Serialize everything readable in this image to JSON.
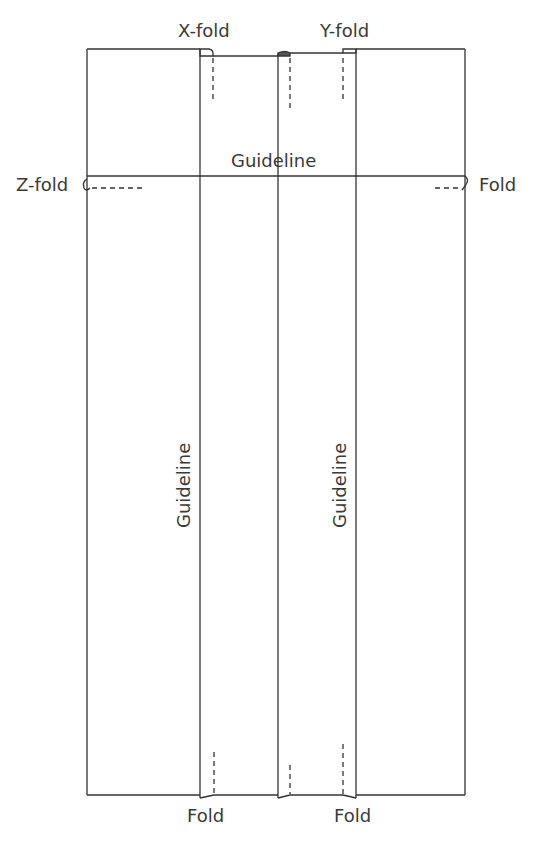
{
  "diagram": {
    "type": "fold-pattern",
    "stroke_color": "#333333",
    "labels": {
      "x_fold": "X-fold",
      "y_fold": "Y-fold",
      "z_fold": "Z-fold",
      "right_fold": "Fold",
      "bottom_fold_left": "Fold",
      "bottom_fold_right": "Fold",
      "guideline_horizontal": "Guideline",
      "guideline_vertical_left": "Guideline",
      "guideline_vertical_right": "Guideline"
    },
    "outline": {
      "left": 87,
      "top": 49,
      "right": 465,
      "bottom": 795
    },
    "guideline_y": 176,
    "vertical_lines_x": [
      200,
      278,
      356
    ],
    "fold_lines_dashed": [
      {
        "name": "x-fold-top",
        "x": 213,
        "y1": 58,
        "y2": 102
      },
      {
        "name": "middle-top",
        "x": 290,
        "y1": 58,
        "y2": 108
      },
      {
        "name": "y-fold-top",
        "x": 343,
        "y1": 58,
        "y2": 103
      },
      {
        "name": "x-fold-bottom",
        "x": 214,
        "y1": 752,
        "y2": 794
      },
      {
        "name": "middle-bottom",
        "x": 290,
        "y1": 765,
        "y2": 794
      },
      {
        "name": "y-fold-bottom",
        "x": 343,
        "y1": 744,
        "y2": 794
      },
      {
        "name": "z-fold-left",
        "y": 188,
        "x1": 92,
        "x2": 145
      },
      {
        "name": "fold-right",
        "y": 188,
        "x1": 435,
        "x2": 462
      }
    ]
  }
}
